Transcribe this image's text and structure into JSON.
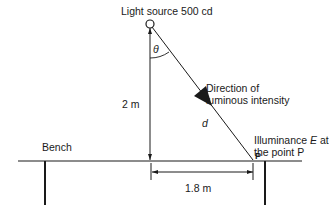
{
  "labels": {
    "light_source": "Light source 500 cd",
    "theta": "θ",
    "direction_line1": "Direction of",
    "direction_line2": "luminous intensity",
    "vertical_distance": "2 m",
    "distance_symbol": "d",
    "illuminance_line1_pre": "Illuminance ",
    "illuminance_symbol": "E",
    "illuminance_line1_post": " at",
    "illuminance_line2": "the point P",
    "point_label": "P",
    "bench": "Bench",
    "horizontal_distance": "1.8 m"
  },
  "values": {
    "luminous_intensity_cd": 500,
    "height_m": 2,
    "horizontal_m": 1.8
  },
  "colors": {
    "line": "#1a1a1a",
    "background": "#ffffff"
  }
}
